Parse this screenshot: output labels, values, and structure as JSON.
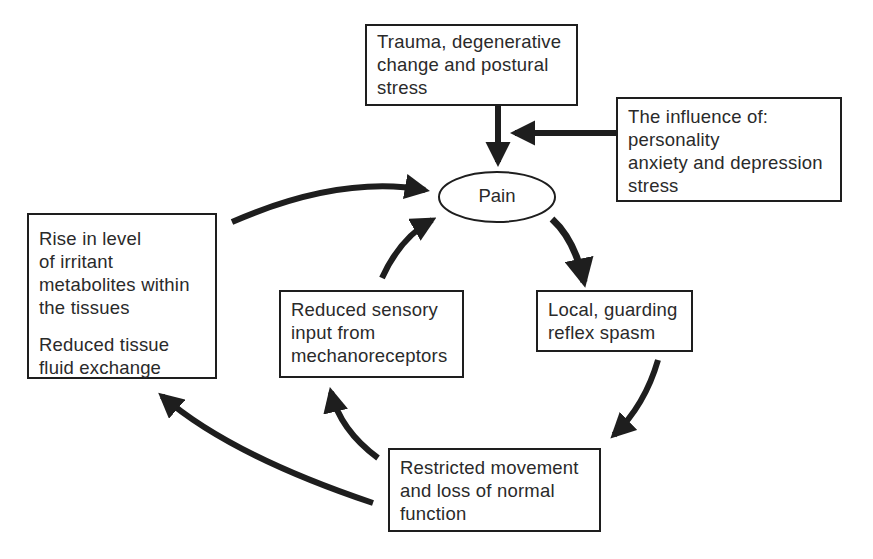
{
  "diagram": {
    "type": "cycle-flowchart",
    "nodes": {
      "pain": {
        "label": "Pain"
      },
      "trauma": {
        "lines": [
          "Trauma, degenerative",
          "change and postural",
          "stress"
        ]
      },
      "influence": {
        "lines": [
          "The influence of:",
          "personality",
          "anxiety and depression",
          "stress"
        ]
      },
      "spasm": {
        "lines": [
          "Local, guarding",
          "reflex spasm"
        ]
      },
      "restricted": {
        "lines": [
          "Restricted movement",
          "and loss of normal",
          "function"
        ]
      },
      "sensory": {
        "lines": [
          "Reduced sensory",
          "input from",
          "mechanoreceptors"
        ]
      },
      "metabolites": {
        "lines": [
          "Rise in level",
          "of irritant",
          "metabolites within",
          "the tissues"
        ],
        "lines2": [
          "Reduced tissue",
          "fluid exchange"
        ]
      }
    },
    "edges": [
      {
        "from": "trauma",
        "to": "pain"
      },
      {
        "from": "influence",
        "to": "pain"
      },
      {
        "from": "pain",
        "to": "spasm"
      },
      {
        "from": "spasm",
        "to": "restricted"
      },
      {
        "from": "restricted",
        "to": "sensory"
      },
      {
        "from": "restricted",
        "to": "metabolites"
      },
      {
        "from": "sensory",
        "to": "pain"
      },
      {
        "from": "metabolites",
        "to": "pain"
      }
    ],
    "colors": {
      "ink": "#1e1e1e",
      "background": "#ffffff"
    }
  }
}
